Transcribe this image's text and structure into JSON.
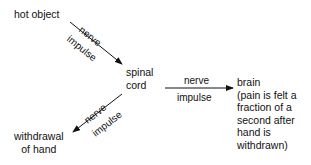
{
  "nodes": {
    "hot_object": "hot object",
    "spinal_cord": [
      "spinal",
      "cord"
    ],
    "brain": [
      "brain",
      "(pain is felt a",
      "fraction of a",
      "second after",
      "hand is",
      "withdrawn)"
    ],
    "withdrawal": [
      "withdrawal",
      "of hand"
    ]
  },
  "edges": {
    "hot_to_spinal": {
      "top": "nerve",
      "bottom": "impulse"
    },
    "spinal_to_brain": {
      "top": "nerve",
      "bottom": "impulse"
    },
    "spinal_to_withdrawal": {
      "top": "nerve",
      "bottom": "impulse"
    }
  },
  "colors": {
    "line": "#111111",
    "text": "#111111"
  }
}
